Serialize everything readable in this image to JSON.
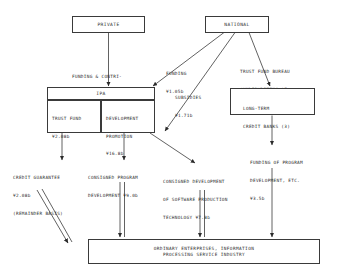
{
  "diagram": {
    "currency_symbol": "¥",
    "nodes": {
      "private": {
        "label": "PRIVATE"
      },
      "national": {
        "label": "NATIONAL"
      },
      "ipa": {
        "label": "IPA"
      },
      "trust_fund": {
        "line1": "TRUST FUND",
        "line2": "¥2.08b"
      },
      "development_promotion": {
        "line1": "DEVELOPMENT",
        "line2": "PROMOTION",
        "line3": "¥16.8b"
      },
      "long_term_credit_banks": {
        "line1": "LONG-TERM",
        "line2": "CREDIT BANKS (3)"
      },
      "ordinary_enterprises": {
        "line1": "ORDINARY ENTERPRISES, INFORMATION",
        "line2": "PROCESSING SERVICE INDUSTRY"
      }
    },
    "edge_labels": {
      "funding_contributions": {
        "line1": "FUNDING & CONTRI-",
        "line2": "BUTIONS ¥1.03b"
      },
      "funding": {
        "line1": "FUNDING",
        "line2": "¥1.05b"
      },
      "subsidies": {
        "line1": "SUBSIDIES",
        "line2": "¥1.71b"
      },
      "trust_fund_bureau": {
        "line1": "TRUST FUND BUREAU",
        "line2": "(UNDERWRITING OF",
        "line3": "BONDS) ¥3.5b"
      },
      "credit_guarantee": {
        "line1": "CREDIT GUARANTEE",
        "line2": "¥2.08b",
        "line3": "(REMAINDER BASIS)"
      },
      "consigned_program_development": {
        "line1": "CONSIGNED PROGRAM",
        "line2": "DEVELOPMENT ¥9.0b"
      },
      "consigned_software_development": {
        "line1": "CONSIGNED DEVELOPMENT",
        "line2": "OF SOFTWARE PRODUCTION",
        "line3": "TECHNOLOGY ¥7.8b"
      },
      "funding_of_program_development": {
        "line1": "FUNDING OF PROGRAM",
        "line2": "DEVELOPMENT, ETC.",
        "line3": "¥3.5b"
      }
    },
    "colors": {
      "stroke": "#3a3a3a",
      "text": "#2a2a2a",
      "background": "#ffffff"
    }
  }
}
